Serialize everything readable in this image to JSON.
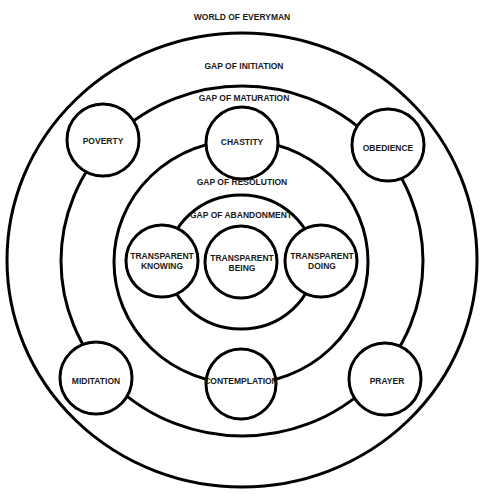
{
  "diagram": {
    "title": "WORLD OF EVERYMAN",
    "gaps": [
      "GAP OF INITIATION",
      "GAP OF MATURATION",
      "GAP OF RESOLUTION",
      "GAP OF ABANDONMENT"
    ],
    "nodes": {
      "poverty": "POVERTY",
      "chastity": "CHASTITY",
      "obedience": "OBEDIENCE",
      "meditation": "MIDITATION",
      "contemplation": "CONTEMPLATION",
      "prayer": "PRAYER",
      "transparent_knowing": [
        "TRANSPARENT",
        "KNOWING"
      ],
      "transparent_being": [
        "TRANSPARENT",
        "BEING"
      ],
      "transparent_doing": [
        "TRANSPARENT",
        "DOING"
      ]
    },
    "colors": {
      "stroke": "#000000",
      "text": "#1a1a1a",
      "background": "#ffffff"
    }
  }
}
